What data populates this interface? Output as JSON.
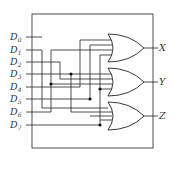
{
  "diagram": {
    "type": "8-to-3 encoder logic diagram",
    "inputs": [
      {
        "name": "D",
        "sub": "0"
      },
      {
        "name": "D",
        "sub": "1"
      },
      {
        "name": "D",
        "sub": "2"
      },
      {
        "name": "D",
        "sub": "3"
      },
      {
        "name": "D",
        "sub": "4"
      },
      {
        "name": "D",
        "sub": "5"
      },
      {
        "name": "D",
        "sub": "6"
      },
      {
        "name": "D",
        "sub": "7"
      }
    ],
    "outputs": [
      "X",
      "Y",
      "Z"
    ],
    "gates": [
      {
        "type": "OR",
        "output": "X"
      },
      {
        "type": "OR",
        "output": "Y"
      },
      {
        "type": "OR",
        "output": "Z"
      }
    ]
  }
}
